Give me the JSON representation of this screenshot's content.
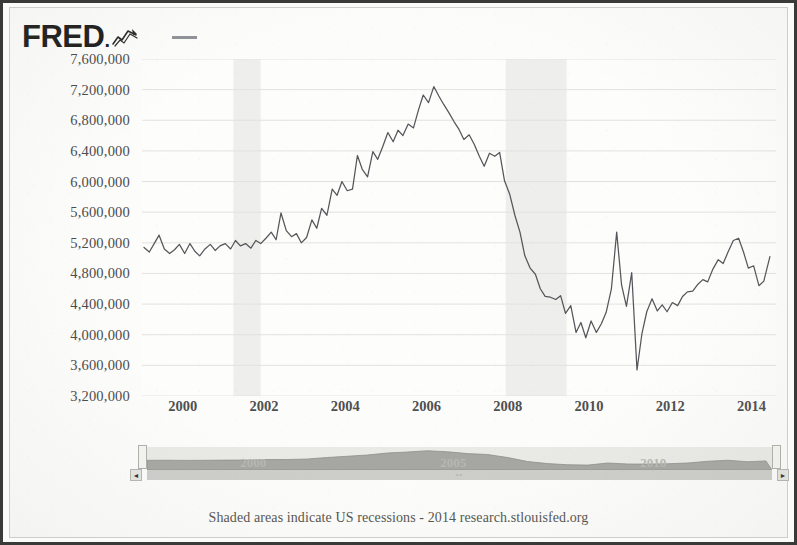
{
  "header": {
    "logo_text": "FRED",
    "logo_dot": ".",
    "logo_glyph_icon": "line-chart-glyph-icon",
    "legend_swatch_icon": "legend-line-swatch-icon",
    "legend_color": "#8f9296"
  },
  "footer": {
    "text": "Shaded areas indicate US recessions - 2014 research.stlouisfed.org"
  },
  "navigator": {
    "year_labels": [
      "2000",
      "2005",
      "2010"
    ],
    "left_arrow_icon": "◄",
    "right_arrow_icon": "►",
    "scroll_mark": "▫▫",
    "series_color": "#a6a6a2",
    "track_color": "#cdcdc9"
  },
  "chart_data": {
    "type": "line",
    "title": "",
    "subtitle": "",
    "xlabel": "",
    "ylabel": "",
    "grid": true,
    "legend_position": "top-left",
    "line_color": "#55565a",
    "recession_band_color": "#eeeeec",
    "gridline_color": "#e2e2de",
    "xlim": [
      1999.0,
      2014.6
    ],
    "ylim": [
      3200000,
      7600000
    ],
    "xticks": [
      2000,
      2002,
      2004,
      2006,
      2008,
      2010,
      2012,
      2014
    ],
    "xtick_labels": [
      "2000",
      "2002",
      "2004",
      "2006",
      "2008",
      "2010",
      "2012",
      "2014"
    ],
    "yticks": [
      3200000,
      3600000,
      4000000,
      4400000,
      4800000,
      5200000,
      5600000,
      6000000,
      6400000,
      6800000,
      7200000,
      7600000
    ],
    "ytick_labels": [
      "3,200,000",
      "3,600,000",
      "4,000,000",
      "4,400,000",
      "4,800,000",
      "5,200,000",
      "5,600,000",
      "6,000,000",
      "6,400,000",
      "6,800,000",
      "7,200,000",
      "7,600,000"
    ],
    "recession_bands": [
      {
        "start": 2001.25,
        "end": 2001.92
      },
      {
        "start": 2007.95,
        "end": 2009.45
      }
    ],
    "series": [
      {
        "name": "",
        "x": [
          1999.05,
          1999.18,
          1999.3,
          1999.42,
          1999.55,
          1999.68,
          1999.8,
          1999.92,
          2000.05,
          2000.18,
          2000.3,
          2000.42,
          2000.55,
          2000.68,
          2000.8,
          2000.92,
          2001.05,
          2001.18,
          2001.3,
          2001.42,
          2001.55,
          2001.68,
          2001.8,
          2001.92,
          2002.05,
          2002.18,
          2002.3,
          2002.42,
          2002.55,
          2002.68,
          2002.8,
          2002.92,
          2003.05,
          2003.18,
          2003.3,
          2003.42,
          2003.55,
          2003.68,
          2003.8,
          2003.92,
          2004.05,
          2004.18,
          2004.3,
          2004.42,
          2004.55,
          2004.68,
          2004.8,
          2004.92,
          2005.05,
          2005.18,
          2005.3,
          2005.42,
          2005.55,
          2005.68,
          2005.8,
          2005.92,
          2006.05,
          2006.18,
          2006.3,
          2006.42,
          2006.55,
          2006.68,
          2006.8,
          2006.92,
          2007.05,
          2007.18,
          2007.3,
          2007.42,
          2007.55,
          2007.68,
          2007.8,
          2007.92,
          2008.05,
          2008.18,
          2008.3,
          2008.42,
          2008.55,
          2008.68,
          2008.8,
          2008.92,
          2009.05,
          2009.18,
          2009.3,
          2009.42,
          2009.55,
          2009.68,
          2009.8,
          2009.92,
          2010.05,
          2010.18,
          2010.3,
          2010.42,
          2010.55,
          2010.68,
          2010.8,
          2010.92,
          2011.05,
          2011.18,
          2011.3,
          2011.42,
          2011.55,
          2011.68,
          2011.8,
          2011.92,
          2012.05,
          2012.18,
          2012.3,
          2012.42,
          2012.55,
          2012.68,
          2012.8,
          2012.92,
          2013.05,
          2013.18,
          2013.3,
          2013.42,
          2013.55,
          2013.68,
          2013.8,
          2013.92,
          2014.05,
          2014.18,
          2014.3,
          2014.45
        ],
        "y": [
          5140000,
          5080000,
          5190000,
          5300000,
          5120000,
          5060000,
          5110000,
          5180000,
          5060000,
          5190000,
          5090000,
          5030000,
          5120000,
          5180000,
          5100000,
          5160000,
          5190000,
          5120000,
          5230000,
          5160000,
          5190000,
          5130000,
          5230000,
          5190000,
          5260000,
          5340000,
          5240000,
          5590000,
          5360000,
          5280000,
          5320000,
          5200000,
          5270000,
          5500000,
          5390000,
          5650000,
          5560000,
          5900000,
          5820000,
          6000000,
          5880000,
          5900000,
          6340000,
          6160000,
          6060000,
          6390000,
          6290000,
          6450000,
          6640000,
          6520000,
          6670000,
          6600000,
          6750000,
          6700000,
          6930000,
          7130000,
          7030000,
          7240000,
          7120000,
          7010000,
          6900000,
          6780000,
          6680000,
          6550000,
          6610000,
          6480000,
          6330000,
          6200000,
          6370000,
          6330000,
          6380000,
          6010000,
          5830000,
          5550000,
          5340000,
          5030000,
          4870000,
          4790000,
          4600000,
          4500000,
          4490000,
          4460000,
          4510000,
          4280000,
          4380000,
          4030000,
          4160000,
          3960000,
          4180000,
          4030000,
          4140000,
          4290000,
          4600000,
          5340000,
          4650000,
          4370000,
          4810000,
          3540000,
          4010000,
          4300000,
          4470000,
          4310000,
          4390000,
          4300000,
          4420000,
          4380000,
          4500000,
          4560000,
          4570000,
          4660000,
          4720000,
          4690000,
          4860000,
          4980000,
          4930000,
          5080000,
          5230000,
          5260000,
          5080000,
          4870000,
          4900000,
          4640000,
          4700000,
          5020000
        ]
      }
    ]
  },
  "navigator_data": {
    "type": "area",
    "x": [
      1999.0,
      1999.5,
      2000.0,
      2000.5,
      2001.0,
      2001.5,
      2002.0,
      2002.5,
      2003.0,
      2003.5,
      2004.0,
      2004.5,
      2005.0,
      2005.5,
      2006.0,
      2006.5,
      2007.0,
      2007.5,
      2008.0,
      2008.5,
      2009.0,
      2009.5,
      2010.0,
      2010.5,
      2011.0,
      2011.5,
      2012.0,
      2012.5,
      2013.0,
      2013.5,
      2014.0,
      2014.45
    ],
    "y": [
      5140000,
      5150000,
      5120000,
      5140000,
      5180000,
      5180000,
      5280000,
      5300000,
      5400000,
      5700000,
      5950000,
      6200000,
      6600000,
      6800000,
      7050000,
      6850000,
      6480000,
      6300000,
      5700000,
      4900000,
      4480000,
      4250000,
      4180000,
      4600000,
      4400000,
      4380000,
      4450000,
      4600000,
      4950000,
      5150000,
      4850000,
      5020000
    ]
  }
}
